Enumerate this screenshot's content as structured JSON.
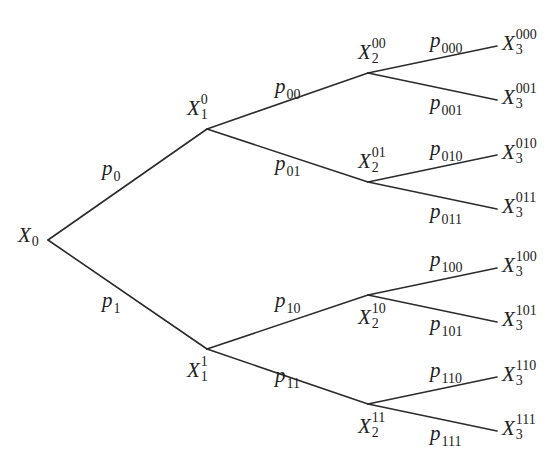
{
  "diagram": {
    "type": "probability-tree",
    "root": {
      "id": "X0",
      "label": "X",
      "sub": "0",
      "sup": "",
      "x": 48,
      "y": 240,
      "lx": 18,
      "ly": 225
    },
    "nodes": [
      {
        "id": "X1_0",
        "label": "X",
        "sub": "1",
        "sup": "0",
        "x": 207,
        "y": 129,
        "lx": 187,
        "ly": 98
      },
      {
        "id": "X1_1",
        "label": "X",
        "sub": "1",
        "sup": "1",
        "x": 207,
        "y": 349,
        "lx": 187,
        "ly": 360
      },
      {
        "id": "X2_00",
        "label": "X",
        "sub": "2",
        "sup": "00",
        "x": 368,
        "y": 73,
        "lx": 358,
        "ly": 42
      },
      {
        "id": "X2_01",
        "label": "X",
        "sub": "2",
        "sup": "01",
        "x": 368,
        "y": 182,
        "lx": 358,
        "ly": 151
      },
      {
        "id": "X2_10",
        "label": "X",
        "sub": "2",
        "sup": "10",
        "x": 368,
        "y": 295,
        "lx": 358,
        "ly": 307
      },
      {
        "id": "X2_11",
        "label": "X",
        "sub": "2",
        "sup": "11",
        "x": 368,
        "y": 404,
        "lx": 358,
        "ly": 416
      },
      {
        "id": "X3_000",
        "label": "X",
        "sub": "3",
        "sup": "000",
        "x": 497,
        "y": 46,
        "lx": 502,
        "ly": 33
      },
      {
        "id": "X3_001",
        "label": "X",
        "sub": "3",
        "sup": "001",
        "x": 497,
        "y": 100,
        "lx": 502,
        "ly": 87
      },
      {
        "id": "X3_010",
        "label": "X",
        "sub": "3",
        "sup": "010",
        "x": 497,
        "y": 155,
        "lx": 502,
        "ly": 142
      },
      {
        "id": "X3_011",
        "label": "X",
        "sub": "3",
        "sup": "011",
        "x": 497,
        "y": 209,
        "lx": 502,
        "ly": 196
      },
      {
        "id": "X3_100",
        "label": "X",
        "sub": "3",
        "sup": "100",
        "x": 497,
        "y": 268,
        "lx": 502,
        "ly": 255
      },
      {
        "id": "X3_101",
        "label": "X",
        "sub": "3",
        "sup": "101",
        "x": 497,
        "y": 322,
        "lx": 502,
        "ly": 309
      },
      {
        "id": "X3_110",
        "label": "X",
        "sub": "3",
        "sup": "110",
        "x": 497,
        "y": 377,
        "lx": 502,
        "ly": 364
      },
      {
        "id": "X3_111",
        "label": "X",
        "sub": "3",
        "sup": "111",
        "x": 497,
        "y": 431,
        "lx": 502,
        "ly": 418
      }
    ],
    "edges": [
      {
        "from": "X0",
        "to": "X1_0",
        "prob": "p",
        "sub": "0",
        "lx": 102,
        "ly": 158
      },
      {
        "from": "X0",
        "to": "X1_1",
        "prob": "p",
        "sub": "1",
        "lx": 102,
        "ly": 290
      },
      {
        "from": "X1_0",
        "to": "X2_00",
        "prob": "p",
        "sub": "00",
        "lx": 275,
        "ly": 76
      },
      {
        "from": "X1_0",
        "to": "X2_01",
        "prob": "p",
        "sub": "01",
        "lx": 275,
        "ly": 153
      },
      {
        "from": "X1_1",
        "to": "X2_10",
        "prob": "p",
        "sub": "10",
        "lx": 275,
        "ly": 290
      },
      {
        "from": "X1_1",
        "to": "X2_11",
        "prob": "p",
        "sub": "11",
        "lx": 275,
        "ly": 365
      },
      {
        "from": "X2_00",
        "to": "X3_000",
        "prob": "p",
        "sub": "000",
        "lx": 430,
        "ly": 30
      },
      {
        "from": "X2_00",
        "to": "X3_001",
        "prob": "p",
        "sub": "001",
        "lx": 430,
        "ly": 92
      },
      {
        "from": "X2_01",
        "to": "X3_010",
        "prob": "p",
        "sub": "010",
        "lx": 430,
        "ly": 138
      },
      {
        "from": "X2_01",
        "to": "X3_011",
        "prob": "p",
        "sub": "011",
        "lx": 430,
        "ly": 201
      },
      {
        "from": "X2_10",
        "to": "X3_100",
        "prob": "p",
        "sub": "100",
        "lx": 430,
        "ly": 249
      },
      {
        "from": "X2_10",
        "to": "X3_101",
        "prob": "p",
        "sub": "101",
        "lx": 430,
        "ly": 313
      },
      {
        "from": "X2_11",
        "to": "X3_110",
        "prob": "p",
        "sub": "110",
        "lx": 430,
        "ly": 360
      },
      {
        "from": "X2_11",
        "to": "X3_111",
        "prob": "p",
        "sub": "111",
        "lx": 430,
        "ly": 423
      }
    ],
    "style": {
      "line_color": "#2b2b2b",
      "text_color": "#222222",
      "background": "#ffffff"
    }
  }
}
